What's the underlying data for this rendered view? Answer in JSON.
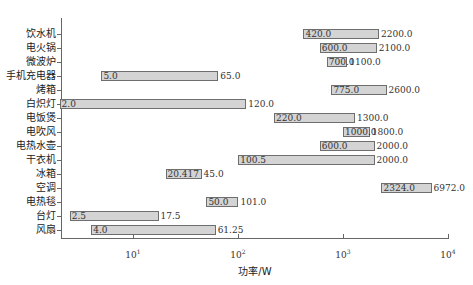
{
  "chart_data": {
    "type": "bar",
    "orientation": "horizontal-range",
    "title": "",
    "xlabel": "功率/W",
    "ylabel": "",
    "xscale": "log",
    "xlim": [
      2.0,
      10000
    ],
    "xticks": [
      {
        "base": "10",
        "exp": "1",
        "value": 10
      },
      {
        "base": "10",
        "exp": "2",
        "value": 100
      },
      {
        "base": "10",
        "exp": "3",
        "value": 1000
      },
      {
        "base": "10",
        "exp": "4",
        "value": 10000
      }
    ],
    "grid": false,
    "legend": null,
    "bar_fill": "#d4d4d4",
    "bar_edge": "#6e6e6e",
    "categories": [
      "饮水机",
      "电火锅",
      "微波炉",
      "手机充电器",
      "烤箱",
      "白炽灯",
      "电饭煲",
      "电吹风",
      "电热水壶",
      "干衣机",
      "冰箱",
      "空调",
      "电热毯",
      "台灯",
      "风扇"
    ],
    "series": [
      {
        "name": "min_power",
        "values": [
          420.0,
          600.0,
          700.0,
          5.0,
          775.0,
          2.0,
          220.0,
          1000.0,
          600.0,
          100.5,
          20.417,
          2324.0,
          50.0,
          2.5,
          4.0
        ]
      },
      {
        "name": "max_power",
        "values": [
          2200.0,
          2100.0,
          1100.0,
          65.0,
          2600.0,
          120.0,
          1300.0,
          1800.0,
          2000.0,
          2000.0,
          45.0,
          6972.0,
          101.0,
          17.5,
          61.25
        ]
      }
    ],
    "min_labels": [
      "420.0",
      "600.0",
      "700.0",
      "5.0",
      "775.0",
      "2.0",
      "220.0",
      "1000.0",
      "600.0",
      "100.5",
      "20.417",
      "2324.0",
      "50.0",
      "2.5",
      "4.0"
    ],
    "max_labels": [
      "2200.0",
      "2100.0",
      "1100.0",
      "65.0",
      "2600.0",
      "120.0",
      "1300.0",
      "1800.0",
      "2000.0",
      "2000.0",
      "45.0",
      "6972.0",
      "101.0",
      "17.5",
      "61.25"
    ]
  }
}
